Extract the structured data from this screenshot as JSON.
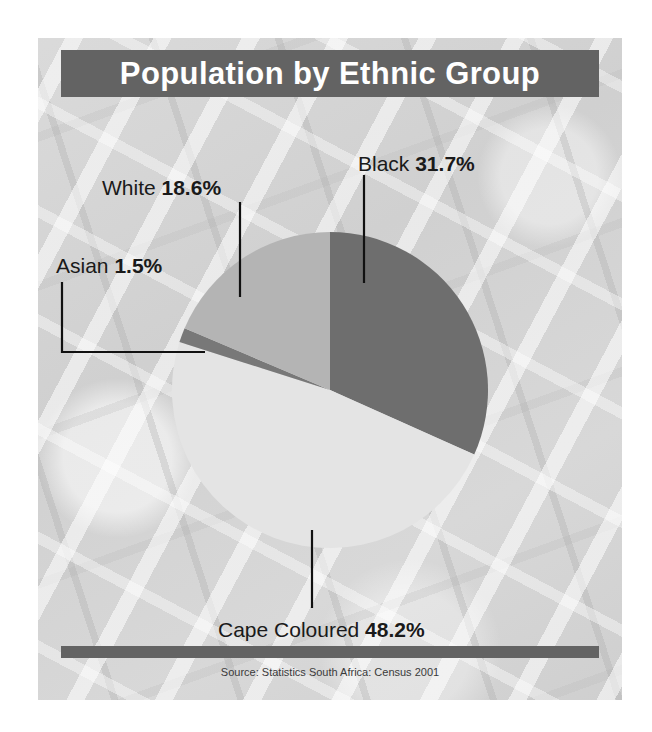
{
  "title": "Population by Ethnic Group",
  "source": "Source: Statistics South Africa: Census 2001",
  "labels": {
    "black_name": "Black ",
    "black_pct": "31.7%",
    "white_name": "White ",
    "white_pct": "18.6%",
    "asian_name": "Asian ",
    "asian_pct": "1.5%",
    "cape_name": "Cape Coloured ",
    "cape_pct": "48.2%"
  },
  "colors": {
    "title_bar": "#636363",
    "panel_background": "#d2d2d2",
    "black_slice": "#6e6e6e",
    "cape_slice": "#e4e4e4",
    "asian_slice": "#787878",
    "white_slice": "#b4b4b4",
    "leader_line": "#111111",
    "text": "#1a1a1a"
  },
  "chart_data": {
    "type": "pie",
    "title": "Population by Ethnic Group",
    "subtitle": "",
    "xlabel": "",
    "ylabel": "",
    "grid": false,
    "legend_position": "none",
    "label_style": "callout leader lines",
    "units": "percent",
    "start_angle_deg": 0,
    "direction": "clockwise",
    "annotations": [
      "Source: Statistics South Africa: Census 2001"
    ],
    "categories": [
      "Black",
      "Cape Coloured",
      "Asian",
      "White"
    ],
    "values": [
      31.7,
      48.2,
      1.5,
      18.6
    ],
    "slice_colors": [
      "#6e6e6e",
      "#e4e4e4",
      "#787878",
      "#b4b4b4"
    ],
    "slices": [
      {
        "label": "Black",
        "value": 31.7,
        "color": "#6e6e6e",
        "display": "31.7%"
      },
      {
        "label": "Cape Coloured",
        "value": 48.2,
        "color": "#e4e4e4",
        "display": "48.2%"
      },
      {
        "label": "Asian",
        "value": 1.5,
        "color": "#787878",
        "display": "1.5%"
      },
      {
        "label": "White",
        "value": 18.6,
        "color": "#b4b4b4",
        "display": "18.6%"
      }
    ]
  }
}
